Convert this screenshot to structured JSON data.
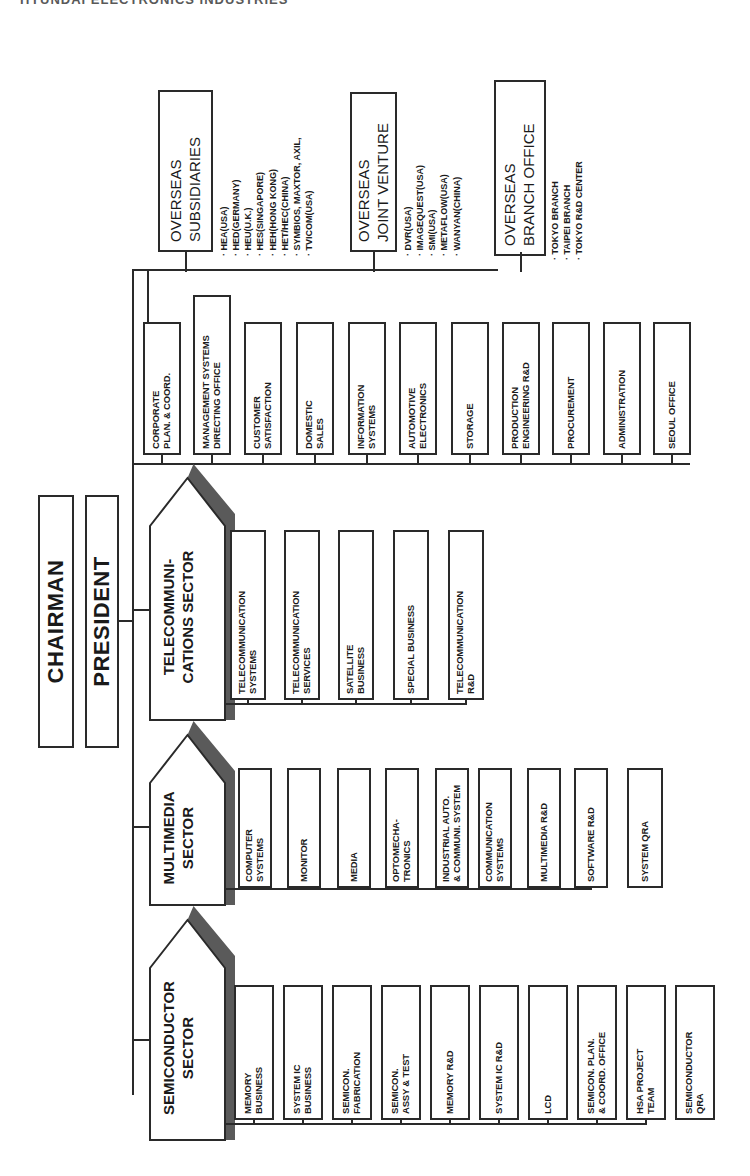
{
  "header": {
    "title": "HYUNDAI ELECTRONICS INDUSTRIES"
  },
  "executives": {
    "chairman": "CHAIRMAN",
    "president": "PRESIDENT"
  },
  "overseas": {
    "subsidiaries": {
      "title": "OVERSEAS\nSUBSIDIARIES",
      "items": [
        "HEA(USA)",
        "HED(GERMANY)",
        "HEU(U.K.)",
        "HES(SINGAPORE)",
        "HEH(HONG KONG)",
        "HET/HEC(CHINA)",
        "SYMBIOS, MAXTOR, AXIL,",
        "TVICOM(USA)"
      ]
    },
    "joint_venture": {
      "title": "OVERSEAS\nJOINT VENTURE",
      "items": [
        "DVR(USA)",
        "IMAGEQUEST(USA)",
        "SMI(USA)",
        "METAFLOW(USA)",
        "WANYAN(CHINA)"
      ]
    },
    "branch_office": {
      "title": "OVERSEAS\nBRANCH OFFICE",
      "items": [
        "TOKYO BRANCH",
        "TAIPEI BRANCH",
        "TOKYO R&D CENTER"
      ]
    }
  },
  "corporate_staff": [
    "CORPORATE\nPLAN. & COORD.",
    "MANAGEMENT SYSTEMS\nDIRECTING OFFICE",
    "CUSTOMER\nSATISFACTION",
    "DOMESTIC\nSALES",
    "INFORMATION\nSYSTEMS",
    "AUTOMOTIVE\nELECTRONICS",
    "STORAGE",
    "PRODUCTION\nENGINEERING R&D",
    "PROCUREMENT",
    "ADMINISTRATION",
    "SEOUL OFFICE"
  ],
  "sectors": [
    {
      "name": "TELECOMMUNI-\nCATIONS SECTOR",
      "units": [
        "TELECOMMUNICATION\nSYSTEMS",
        "TELECOMMUNICATION\nSERVICES",
        "SATELLITE\nBUSINESS",
        "SPECIAL BUSINESS",
        "TELECOMMUNICATION\nR&D"
      ]
    },
    {
      "name": "MULTIMEDIA\nSECTOR",
      "units": [
        "COMPUTER\nSYSTEMS",
        "MONITOR",
        "MEDIA",
        "OPTOMECHA-\nTRONICS",
        "INDUSTRIAL AUTO.\n& COMMUNI. SYSTEM",
        "COMMUNICATION\nSYSTEMS",
        "MULTIMEDIA R&D",
        "SOFTWARE R&D"
      ],
      "standalone": "SYSTEM QRA"
    },
    {
      "name": "SEMICONDUCTOR\nSECTOR",
      "units": [
        "MEMORY\nBUSINESS",
        "SYSTEM IC\nBUSINESS",
        "SEMICON.\nFABRICATION",
        "SEMICON.\nASSY & TEST",
        "MEMORY R&D",
        "SYSTEM IC R&D",
        "LCD",
        "SEMICON. PLAN.\n& COORD. OFFICE",
        "HSA PROJECT\nTEAM"
      ],
      "standalone": "SEMICONDUCTOR\nQRA"
    }
  ]
}
